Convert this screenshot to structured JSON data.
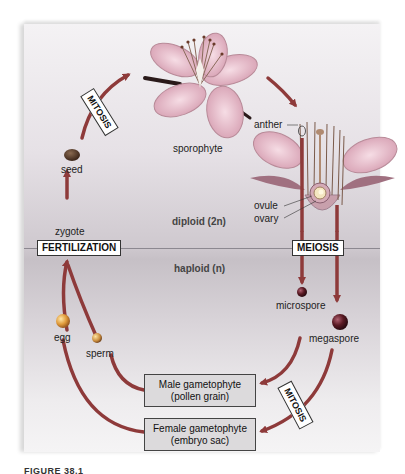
{
  "diagram": {
    "regions": {
      "diploid": "diploid (2n)",
      "haploid": "haploid (n)"
    },
    "processes": {
      "fertilization": "FERTILIZATION",
      "meiosis": "MEIOSIS",
      "mitosis_top": "MITOSIS",
      "mitosis_bottom": "MITOSIS"
    },
    "structures": {
      "sporophyte": "sporophyte",
      "seed": "seed",
      "zygote": "zygote",
      "anther": "anther",
      "ovule": "ovule",
      "ovary": "ovary",
      "microspore": "microspore",
      "megaspore": "megaspore",
      "egg": "egg",
      "sperm": "sperm"
    },
    "stages": {
      "male_line1": "Male gametophyte",
      "male_line2": "(pollen grain)",
      "female_line1": "Female gametophyte",
      "female_line2": "(embryo sac)"
    },
    "caption": "FIGURE 38.1"
  },
  "colors": {
    "arrow": "#8e3a3a",
    "flower": "#e9c3cf",
    "flower_shade": "#c98aa0",
    "egg": "#e0a040",
    "spore": "#6a1f2a",
    "box_fill": "#dcdadc"
  }
}
